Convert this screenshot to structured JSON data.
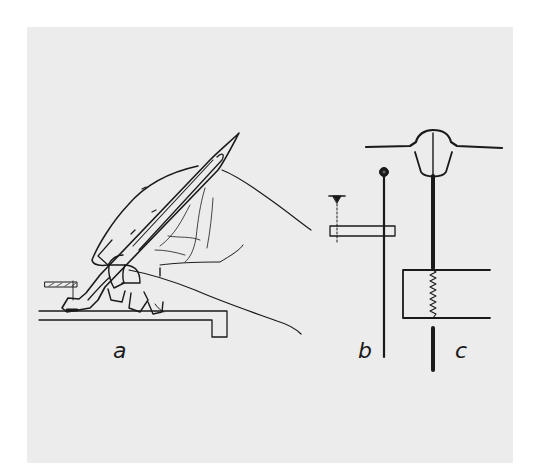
{
  "figure": {
    "background_color": "#ececec",
    "ink_color": "#1a1a1a",
    "panels": [
      {
        "id": "a",
        "label": "a",
        "description": "Hand holding a pen-like instrument at an angle against a flat surface with a small stepped edge"
      },
      {
        "id": "b",
        "label": "b",
        "description": "Thin vertical rod with a round knob on top passing through a horizontal rectangular bar, with a dashed guide line and small marker"
      },
      {
        "id": "c",
        "label": "c",
        "description": "Thick vertical shaft suspended from a domed cap on a horizontal line, passing through a rectangular housing containing a coil spring"
      }
    ]
  }
}
